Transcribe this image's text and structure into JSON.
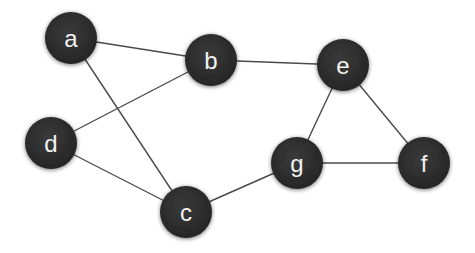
{
  "diagram": {
    "type": "undirected-graph",
    "node_radius": 26,
    "node_color": "#2d2d2d",
    "label_color": "#f2f2f2",
    "edge_color": "#4a4a4a",
    "nodes": [
      {
        "id": "a",
        "label": "a",
        "x": 71,
        "y": 38
      },
      {
        "id": "b",
        "label": "b",
        "x": 211,
        "y": 60
      },
      {
        "id": "d",
        "label": "d",
        "x": 51,
        "y": 143
      },
      {
        "id": "c",
        "label": "c",
        "x": 186,
        "y": 212
      },
      {
        "id": "e",
        "label": "e",
        "x": 343,
        "y": 65
      },
      {
        "id": "g",
        "label": "g",
        "x": 297,
        "y": 163
      },
      {
        "id": "f",
        "label": "f",
        "x": 424,
        "y": 163
      }
    ],
    "edges": [
      {
        "from": "a",
        "to": "b"
      },
      {
        "from": "a",
        "to": "c"
      },
      {
        "from": "d",
        "to": "b"
      },
      {
        "from": "d",
        "to": "c"
      },
      {
        "from": "b",
        "to": "e"
      },
      {
        "from": "c",
        "to": "g"
      },
      {
        "from": "e",
        "to": "g"
      },
      {
        "from": "e",
        "to": "f"
      },
      {
        "from": "g",
        "to": "f"
      }
    ]
  }
}
